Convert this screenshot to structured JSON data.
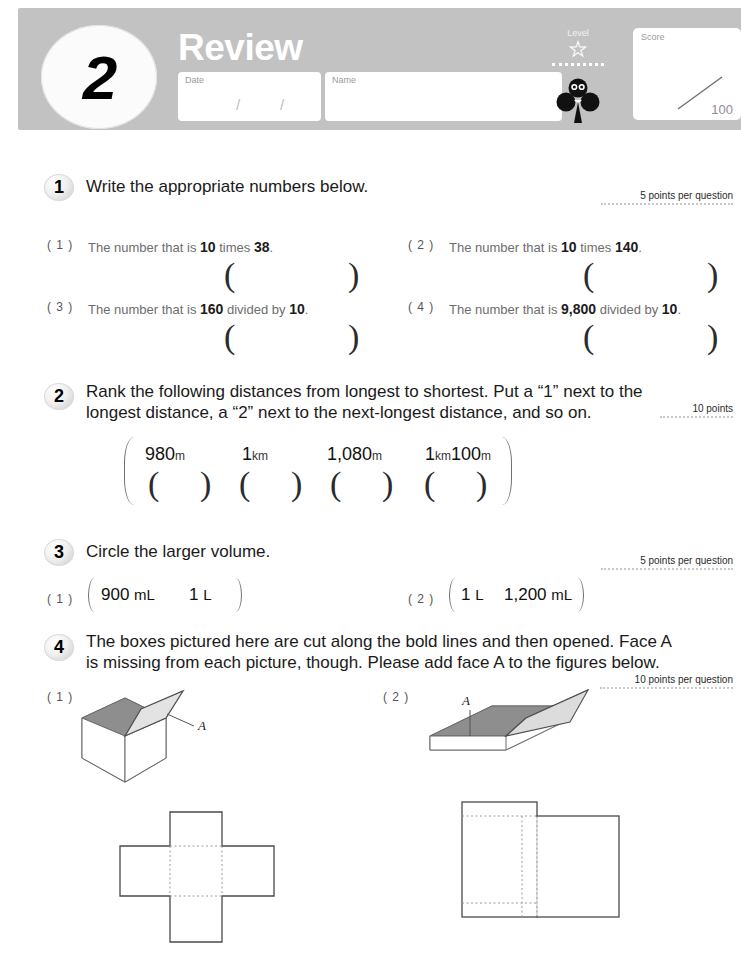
{
  "header": {
    "badge_number": "2",
    "title": "Review",
    "date_label": "Date",
    "date_slash_1": "/",
    "date_slash_2": "/",
    "name_label": "Name",
    "level_label": "Level",
    "level_star_icon": "star-icon",
    "mascot_icon": "clover-mascot-icon",
    "score_label": "Score",
    "score_max": "100",
    "band_color": "#c2c2c2"
  },
  "problems": [
    {
      "number": "1",
      "title": "Write the appropriate numbers below.",
      "points": "5 points per question",
      "items": [
        {
          "label": "( 1 )",
          "text_before": "The number that is ",
          "b1": "10",
          "mid": " times ",
          "b2": "38",
          "text_after": "."
        },
        {
          "label": "( 2 )",
          "text_before": "The number that is ",
          "b1": "10",
          "mid": " times ",
          "b2": "140",
          "text_after": "."
        },
        {
          "label": "( 3 )",
          "text_before": "The number that is ",
          "b1": "160",
          "mid": " divided by ",
          "b2": "10",
          "text_after": "."
        },
        {
          "label": "( 4 )",
          "text_before": "The number that is ",
          "b1": "9,800",
          "mid": " divided by ",
          "b2": "10",
          "text_after": "."
        }
      ],
      "answer_open": "(",
      "answer_close": ")"
    },
    {
      "number": "2",
      "title_line1": "Rank the following distances from longest to shortest. Put a “1” next to the",
      "title_line2": "longest distance, a “2” next to the next-longest distance, and so on.",
      "points": "10 points",
      "distances": [
        {
          "value": "980",
          "unit": "m"
        },
        {
          "value": "1",
          "unit": "km"
        },
        {
          "value": "1,080",
          "unit": "m"
        },
        {
          "value": "1",
          "unit": "km",
          "value2": "100",
          "unit2": "m"
        }
      ],
      "answer_open": "(",
      "answer_close": ")"
    },
    {
      "number": "3",
      "title": "Circle the larger volume.",
      "points": "5 points per question",
      "items": [
        {
          "label": "( 1 )",
          "left_value": "900",
          "left_unit": "mL",
          "right_value": "1",
          "right_unit": "L"
        },
        {
          "label": "( 2 )",
          "left_value": "1",
          "left_unit": "L",
          "right_value": "1,200",
          "right_unit": "mL"
        }
      ]
    },
    {
      "number": "4",
      "title_line1": "The boxes pictured here are cut along the bold lines and then opened. Face A",
      "title_line2": "is missing from each picture, though. Please add face A to the figures below.",
      "points": "10 points per question",
      "figures": [
        {
          "label": "( 1 )",
          "face_label": "A",
          "box_type": "open-cube-box",
          "net_type": "cross-net"
        },
        {
          "label": "( 2 )",
          "face_label": "A",
          "box_type": "shallow-tray-box",
          "net_type": "two-rectangle-net"
        }
      ]
    }
  ]
}
